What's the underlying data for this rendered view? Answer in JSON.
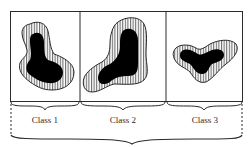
{
  "figure": {
    "type": "class-partition-diagram",
    "panels": [
      {
        "id": "class-1",
        "label": "Class 1",
        "shape": "blob with hatched outer region and solid black core"
      },
      {
        "id": "class-2",
        "label": "Class 2",
        "shape": "blob with hatched outer region and solid black core"
      },
      {
        "id": "class-3",
        "label": "Class 3",
        "shape": "blob with hatched outer region and solid black core"
      }
    ],
    "grouping_brace": "spans all three classes",
    "colors": {
      "stroke": "#2a2a2a",
      "core_fill": "#000000",
      "hatch": "#2a2a2a",
      "background": "#ffffff"
    }
  }
}
